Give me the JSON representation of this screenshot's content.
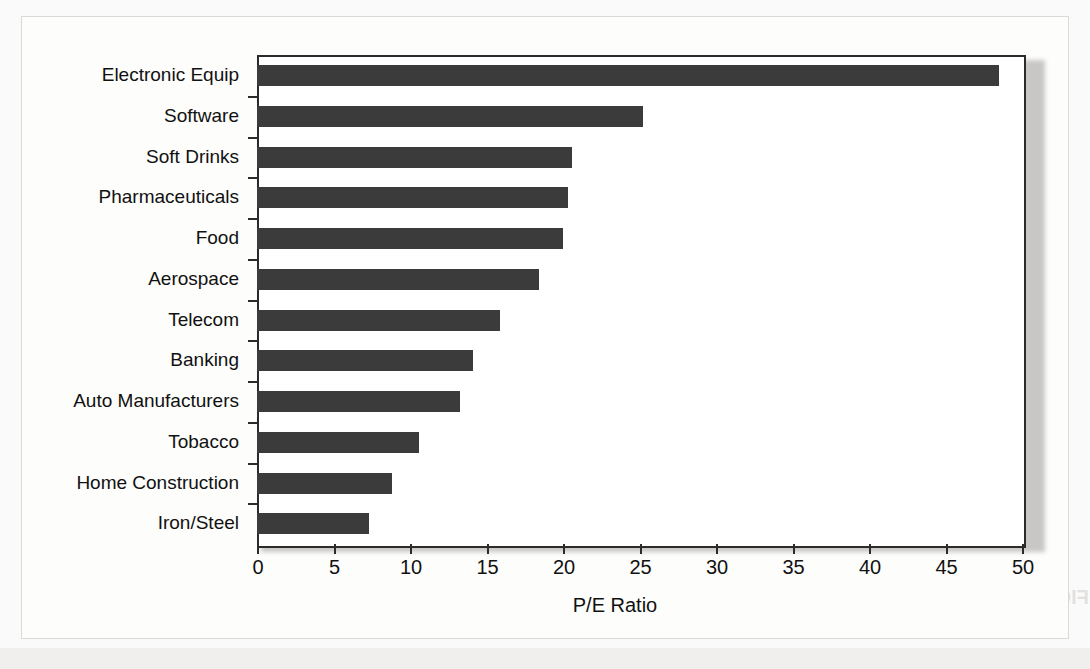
{
  "chart_data": {
    "type": "bar",
    "orientation": "horizontal",
    "title": "",
    "xlabel": "P/E Ratio",
    "ylabel": "",
    "xlim": [
      0,
      50
    ],
    "xticks": [
      0,
      5,
      10,
      15,
      20,
      25,
      30,
      35,
      40,
      45,
      50
    ],
    "grid": false,
    "legend": null,
    "bar_color": "#3b3b3b",
    "categories": [
      "Electronic Equip",
      "Software",
      "Soft Drinks",
      "Pharmaceuticals",
      "Food",
      "Aerospace",
      "Telecom",
      "Banking",
      "Auto Manufacturers",
      "Tobacco",
      "Home Construction",
      "Iron/Steel"
    ],
    "values": [
      48.5,
      25.2,
      20.6,
      20.3,
      20.0,
      18.4,
      15.9,
      14.1,
      13.3,
      10.6,
      8.8,
      7.3
    ]
  },
  "ghost_text": {
    "united": "United Rental",
    "figure": "FIGURE 16.5  Price–earnings ratios"
  }
}
